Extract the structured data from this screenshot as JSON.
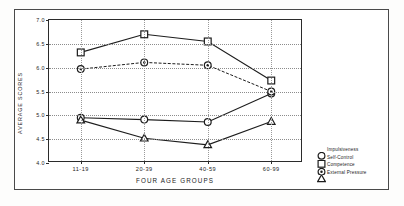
{
  "chart_data": {
    "type": "line",
    "title": "",
    "xlabel": "FOUR AGE GROUPS",
    "ylabel": "AVERAGE SCORES",
    "categories": [
      "11-19",
      "20-39",
      "40-59",
      "60-99"
    ],
    "ylim": [
      4.0,
      7.0
    ],
    "yticks": [
      "7.0",
      "6.5",
      "6.0",
      "5.5",
      "5.0",
      "4.5",
      "4.0"
    ],
    "ytick_values": [
      7.0,
      6.5,
      6.0,
      5.5,
      5.0,
      4.5,
      4.0
    ],
    "grid": true,
    "legend_position": "right",
    "series": [
      {
        "name": "Impulsiveness",
        "marker": "open-circle",
        "line": "solid",
        "color": "#1d1d1d",
        "values": [
          4.95,
          4.91,
          4.86,
          5.46
        ]
      },
      {
        "name": "Self-Control",
        "marker": "open-square",
        "line": "solid",
        "color": "#1d1d1d",
        "values": [
          6.32,
          6.7,
          6.55,
          5.73
        ]
      },
      {
        "name": "Competence",
        "marker": "dotted-circle",
        "line": "dashed",
        "color": "#1d1d1d",
        "values": [
          5.97,
          6.11,
          6.05,
          5.5
        ]
      },
      {
        "name": "External Pressure",
        "marker": "open-triangle",
        "line": "solid",
        "color": "#1d1d1d",
        "values": [
          4.9,
          4.52,
          4.38,
          4.87
        ]
      }
    ]
  }
}
